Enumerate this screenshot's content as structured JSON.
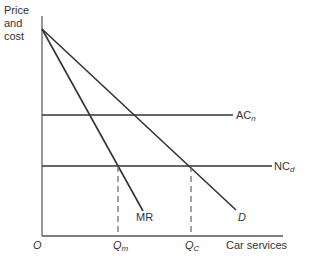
{
  "diagram": {
    "y_axis_label": [
      "Price",
      "and",
      "cost"
    ],
    "x_axis_label": "Car services",
    "origin_label": "O",
    "curves": {
      "ac": {
        "label": "AC",
        "subscript": "n"
      },
      "nc": {
        "label": "NC",
        "subscript": "d"
      },
      "mr": {
        "label": "MR"
      },
      "d": {
        "label": "D"
      }
    },
    "x_ticks": {
      "qm": {
        "label": "Q",
        "subscript": "m"
      },
      "qc": {
        "label": "Q",
        "subscript": "C"
      }
    }
  }
}
